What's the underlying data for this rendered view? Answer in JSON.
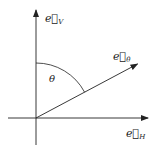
{
  "diagram": {
    "type": "vector-axes",
    "labels": {
      "vertical_axis": "e⃗",
      "vertical_sub": "V",
      "horizontal_axis": "e⃗",
      "horizontal_sub": "H",
      "vector": "e⃗",
      "vector_sub": "θ",
      "angle": "θ"
    },
    "angle_from_vertical_deg": 62,
    "colors": {
      "line": "#222222",
      "background": "#ffffff"
    }
  }
}
